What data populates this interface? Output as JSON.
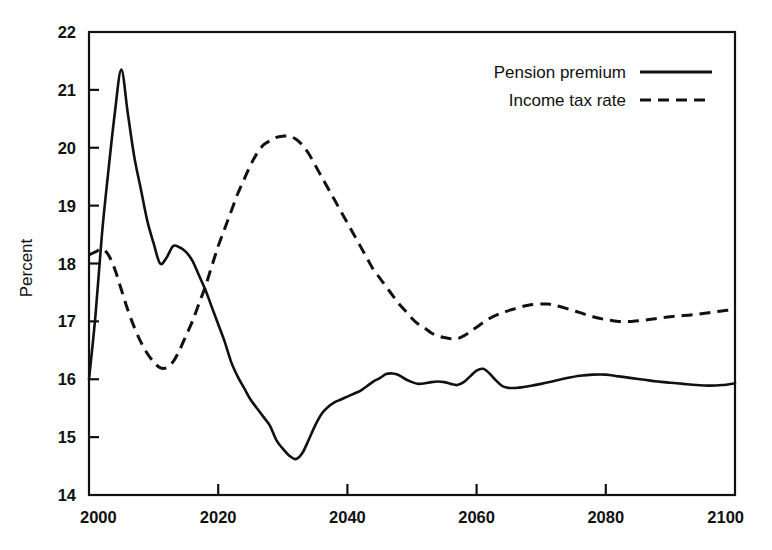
{
  "chart_data": {
    "type": "line",
    "title": "",
    "subtitle": "",
    "xlabel": "",
    "ylabel": "Percent",
    "xlim": [
      2000,
      2100
    ],
    "ylim": [
      14,
      22
    ],
    "xticks": [
      2000,
      2020,
      2040,
      2060,
      2080,
      2100
    ],
    "xtick_labels": [
      "2000",
      "2020",
      "2040",
      "2060",
      "2080",
      "2100"
    ],
    "yticks": [
      14,
      15,
      16,
      17,
      18,
      19,
      20,
      21,
      22
    ],
    "ytick_labels": [
      "14",
      "15",
      "16",
      "17",
      "18",
      "19",
      "20",
      "21",
      "22"
    ],
    "grid": false,
    "legend_position": "top-right",
    "series": [
      {
        "name": "Pension premium",
        "style": "solid",
        "color": "#111111",
        "x": [
          2000,
          2001,
          2002,
          2003,
          2004,
          2005,
          2006,
          2007,
          2008,
          2009,
          2010,
          2011,
          2012,
          2013,
          2014,
          2015,
          2016,
          2017,
          2018,
          2019,
          2020,
          2021,
          2022,
          2023,
          2024,
          2025,
          2026,
          2027,
          2028,
          2029,
          2030,
          2031,
          2032,
          2033,
          2034,
          2035,
          2036,
          2037,
          2038,
          2039,
          2040,
          2041,
          2042,
          2043,
          2044,
          2045,
          2046,
          2047,
          2048,
          2049,
          2050,
          2051,
          2052,
          2053,
          2054,
          2055,
          2056,
          2057,
          2058,
          2059,
          2060,
          2061,
          2062,
          2063,
          2064,
          2065,
          2066,
          2067,
          2068,
          2070,
          2072,
          2074,
          2076,
          2078,
          2080,
          2082,
          2084,
          2086,
          2088,
          2090,
          2092,
          2094,
          2096,
          2098,
          2100
        ],
        "y": [
          16.0,
          17.1,
          18.5,
          19.6,
          20.6,
          21.35,
          20.6,
          19.85,
          19.3,
          18.75,
          18.35,
          18.0,
          18.1,
          18.3,
          18.28,
          18.2,
          18.05,
          17.8,
          17.55,
          17.25,
          16.95,
          16.65,
          16.3,
          16.05,
          15.85,
          15.65,
          15.5,
          15.35,
          15.2,
          14.95,
          14.8,
          14.68,
          14.62,
          14.72,
          14.95,
          15.2,
          15.4,
          15.52,
          15.6,
          15.65,
          15.7,
          15.75,
          15.8,
          15.88,
          15.96,
          16.02,
          16.09,
          16.1,
          16.07,
          16.0,
          15.95,
          15.92,
          15.93,
          15.95,
          15.96,
          15.95,
          15.92,
          15.9,
          15.95,
          16.05,
          16.15,
          16.18,
          16.1,
          15.98,
          15.88,
          15.85,
          15.85,
          15.86,
          15.88,
          15.92,
          15.97,
          16.02,
          16.06,
          16.08,
          16.08,
          16.05,
          16.02,
          15.99,
          15.96,
          15.94,
          15.92,
          15.9,
          15.89,
          15.9,
          15.93
        ]
      },
      {
        "name": "Income tax rate",
        "style": "dashed",
        "color": "#111111",
        "x": [
          2000,
          2001,
          2002,
          2003,
          2004,
          2005,
          2006,
          2007,
          2008,
          2009,
          2010,
          2011,
          2012,
          2013,
          2014,
          2015,
          2016,
          2017,
          2018,
          2019,
          2020,
          2021,
          2022,
          2023,
          2024,
          2025,
          2026,
          2027,
          2028,
          2029,
          2030,
          2031,
          2032,
          2033,
          2034,
          2035,
          2036,
          2037,
          2038,
          2039,
          2040,
          2041,
          2042,
          2043,
          2044,
          2045,
          2046,
          2047,
          2048,
          2049,
          2050,
          2051,
          2052,
          2053,
          2054,
          2055,
          2056,
          2057,
          2058,
          2059,
          2060,
          2062,
          2064,
          2066,
          2068,
          2070,
          2071,
          2072,
          2074,
          2076,
          2078,
          2080,
          2082,
          2084,
          2086,
          2088,
          2090,
          2092,
          2094,
          2096,
          2098,
          2100
        ],
        "y": [
          18.15,
          18.2,
          18.25,
          18.15,
          17.9,
          17.55,
          17.2,
          16.9,
          16.65,
          16.45,
          16.3,
          16.2,
          16.2,
          16.3,
          16.5,
          16.75,
          17.0,
          17.3,
          17.6,
          17.95,
          18.3,
          18.6,
          18.9,
          19.2,
          19.45,
          19.7,
          19.9,
          20.05,
          20.12,
          20.18,
          20.2,
          20.2,
          20.15,
          20.05,
          19.9,
          19.7,
          19.5,
          19.3,
          19.1,
          18.9,
          18.7,
          18.5,
          18.3,
          18.1,
          17.9,
          17.75,
          17.6,
          17.45,
          17.3,
          17.18,
          17.05,
          16.95,
          16.88,
          16.8,
          16.75,
          16.72,
          16.7,
          16.7,
          16.75,
          16.82,
          16.9,
          17.05,
          17.15,
          17.22,
          17.28,
          17.3,
          17.3,
          17.28,
          17.22,
          17.15,
          17.08,
          17.03,
          17.0,
          17.0,
          17.02,
          17.05,
          17.08,
          17.1,
          17.12,
          17.15,
          17.18,
          17.2
        ]
      }
    ]
  },
  "axes": {
    "y_title": "Percent"
  },
  "legend": {
    "entries": [
      {
        "label": "Pension premium",
        "style": "solid"
      },
      {
        "label": "Income tax rate",
        "style": "dashed"
      }
    ]
  }
}
